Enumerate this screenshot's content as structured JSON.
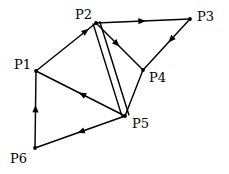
{
  "figure": {
    "type": "directed-graph",
    "background_color": "#ffffff",
    "stroke_color": "#000000",
    "label_color": "#000000"
  },
  "nodes": [
    {
      "id": "P1",
      "label": "P1",
      "x": 36,
      "y": 71,
      "label_x": 14,
      "label_y": 58
    },
    {
      "id": "P2",
      "label": "P2",
      "x": 96,
      "y": 23,
      "label_x": 75,
      "label_y": 8
    },
    {
      "id": "P3",
      "label": "P3",
      "x": 190,
      "y": 19,
      "label_x": 197,
      "label_y": 10
    },
    {
      "id": "P4",
      "label": "P4",
      "x": 143,
      "y": 70,
      "label_x": 149,
      "label_y": 71
    },
    {
      "id": "P5",
      "label": "P5",
      "x": 125,
      "y": 116,
      "label_x": 132,
      "label_y": 117
    },
    {
      "id": "P6",
      "label": "P6",
      "x": 35,
      "y": 148,
      "label_x": 10,
      "label_y": 152
    }
  ],
  "edges": [
    {
      "id": "e1",
      "from": "P1",
      "to": "P2",
      "directed": true,
      "arrow_t": 0.88,
      "name": "edge-p1-p2"
    },
    {
      "id": "e2",
      "from": "P2",
      "to": "P3",
      "directed": true,
      "arrow_t": 0.53,
      "name": "edge-p2-p3"
    },
    {
      "id": "e3",
      "from": "P2",
      "to": "P4",
      "directed": true,
      "arrow_t": 0.5,
      "name": "edge-p2-p4"
    },
    {
      "id": "e4",
      "from": "P2",
      "to": "P5",
      "directed": false,
      "arrow_t": 0,
      "name": "edge-p2-p5-a",
      "offset": -4
    },
    {
      "id": "e5",
      "from": "P2",
      "to": "P5",
      "directed": false,
      "arrow_t": 0,
      "name": "edge-p2-p5-b",
      "offset": 3
    },
    {
      "id": "e6",
      "from": "P3",
      "to": "P4",
      "directed": true,
      "arrow_t": 0.46,
      "name": "edge-p3-p4"
    },
    {
      "id": "e7",
      "from": "P4",
      "to": "P5",
      "directed": false,
      "arrow_t": 0,
      "name": "edge-p4-p5"
    },
    {
      "id": "e8",
      "from": "P5",
      "to": "P1",
      "directed": true,
      "arrow_t": 0.52,
      "name": "edge-p5-p1"
    },
    {
      "id": "e9",
      "from": "P5",
      "to": "P6",
      "directed": true,
      "arrow_t": 0.53,
      "name": "edge-p5-p6"
    },
    {
      "id": "e10",
      "from": "P6",
      "to": "P1",
      "directed": true,
      "arrow_t": 0.56,
      "name": "edge-p6-p1"
    }
  ]
}
